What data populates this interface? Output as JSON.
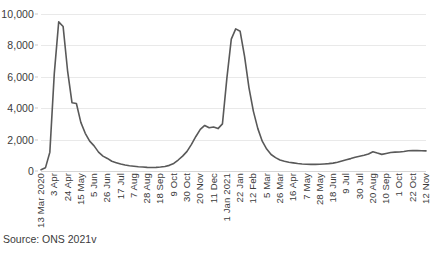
{
  "source_note": "Source: ONS 2021v",
  "chart_data": {
    "type": "line",
    "title": "",
    "subtitle": "",
    "xlabel": "",
    "ylabel": "",
    "ylim": [
      0,
      10000
    ],
    "y_ticks": [
      0,
      2000,
      4000,
      6000,
      8000,
      10000
    ],
    "y_tick_labels": [
      "0",
      "2,000",
      "4,000",
      "6,000",
      "8,000",
      "10,000"
    ],
    "grid": true,
    "legend": "none",
    "line_color": "#595959",
    "gridline_color": "#e9e9e9",
    "x_tick_labels": [
      "13 Mar 2020",
      "3 Apr",
      "24 Apr",
      "15 May",
      "5 Jun",
      "26 Jun",
      "17 Jul",
      "7 Aug",
      "28 Aug",
      "18 Sep",
      "9 Oct",
      "30 Oct",
      "20 Nov",
      "11 Dec",
      "1 Jan 2021",
      "22 Jan",
      "12 Feb",
      "5 Mar",
      "26 Mar",
      "16 Apr",
      "7 May",
      "28 May",
      "18 Jun",
      "9 Jul",
      "30 Jul",
      "20 Aug",
      "10 Sep",
      "1 Oct",
      "22 Oct",
      "12 Nov"
    ],
    "x_tick_interval_weeks": 3,
    "categories": [
      "13 Mar 2020",
      "20 Mar 2020",
      "27 Mar 2020",
      "3 Apr 2020",
      "10 Apr 2020",
      "17 Apr 2020",
      "24 Apr 2020",
      "1 May 2020",
      "8 May 2020",
      "15 May 2020",
      "22 May 2020",
      "29 May 2020",
      "5 Jun 2020",
      "12 Jun 2020",
      "19 Jun 2020",
      "26 Jun 2020",
      "3 Jul 2020",
      "10 Jul 2020",
      "17 Jul 2020",
      "24 Jul 2020",
      "31 Jul 2020",
      "7 Aug 2020",
      "14 Aug 2020",
      "21 Aug 2020",
      "28 Aug 2020",
      "4 Sep 2020",
      "11 Sep 2020",
      "18 Sep 2020",
      "25 Sep 2020",
      "2 Oct 2020",
      "9 Oct 2020",
      "16 Oct 2020",
      "23 Oct 2020",
      "30 Oct 2020",
      "6 Nov 2020",
      "13 Nov 2020",
      "20 Nov 2020",
      "27 Nov 2020",
      "4 Dec 2020",
      "11 Dec 2020",
      "18 Dec 2020",
      "25 Dec 2020",
      "1 Jan 2021",
      "8 Jan 2021",
      "15 Jan 2021",
      "22 Jan 2021",
      "29 Jan 2021",
      "5 Feb 2021",
      "12 Feb 2021",
      "19 Feb 2021",
      "26 Feb 2021",
      "5 Mar 2021",
      "12 Mar 2021",
      "19 Mar 2021",
      "26 Mar 2021",
      "2 Apr 2021",
      "9 Apr 2021",
      "16 Apr 2021",
      "23 Apr 2021",
      "30 Apr 2021",
      "7 May 2021",
      "14 May 2021",
      "21 May 2021",
      "28 May 2021",
      "4 Jun 2021",
      "11 Jun 2021",
      "18 Jun 2021",
      "25 Jun 2021",
      "2 Jul 2021",
      "9 Jul 2021",
      "16 Jul 2021",
      "23 Jul 2021",
      "30 Jul 2021",
      "6 Aug 2021",
      "13 Aug 2021",
      "20 Aug 2021",
      "27 Aug 2021",
      "3 Sep 2021",
      "10 Sep 2021",
      "17 Sep 2021",
      "24 Sep 2021",
      "1 Oct 2021",
      "8 Oct 2021",
      "15 Oct 2021",
      "22 Oct 2021",
      "29 Oct 2021",
      "5 Nov 2021",
      "12 Nov 2021"
    ],
    "values": [
      80,
      200,
      1200,
      6200,
      9500,
      9200,
      6400,
      4350,
      4300,
      3100,
      2400,
      1900,
      1600,
      1200,
      950,
      800,
      620,
      530,
      440,
      380,
      330,
      300,
      270,
      250,
      230,
      220,
      230,
      250,
      290,
      360,
      480,
      700,
      950,
      1250,
      1700,
      2200,
      2650,
      2900,
      2750,
      2800,
      2700,
      3000,
      5900,
      8400,
      9050,
      8900,
      7300,
      5300,
      3800,
      2700,
      1900,
      1400,
      1050,
      850,
      700,
      620,
      560,
      520,
      480,
      450,
      430,
      420,
      420,
      430,
      450,
      470,
      500,
      560,
      640,
      720,
      790,
      880,
      940,
      1000,
      1080,
      1230,
      1140,
      1060,
      1120,
      1180,
      1200,
      1210,
      1240,
      1290,
      1310,
      1300,
      1290,
      1280
    ]
  }
}
